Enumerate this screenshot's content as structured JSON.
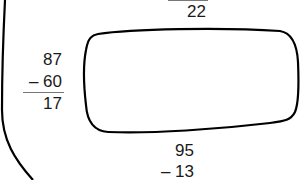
{
  "problems": {
    "top": {
      "result": "22"
    },
    "left": {
      "minuend": "87",
      "subtrahend": "– 60",
      "result": "17"
    },
    "bottom": {
      "minuend": "95",
      "subtrahend": "– 13"
    }
  },
  "colors": {
    "stroke": "#000000",
    "text": "#1a1a1a",
    "rule": "#777777"
  }
}
